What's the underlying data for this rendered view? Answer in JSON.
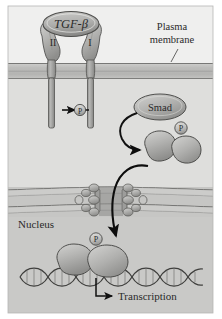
{
  "figure": {
    "background_color": "#ffffff",
    "panel_color": "#d8d8d6",
    "extracellular_color": "#ececeb",
    "cytoplasm_color": "#dddddb",
    "nucleus_color": "#c9c9c7",
    "membrane_color": "#c2c2c0",
    "protein_fill": "#b9b9b7",
    "protein_stroke": "#5a5a58",
    "outline_color": "#555553",
    "arrow_color": "#111111",
    "text_color": "#2a2a2a"
  },
  "labels": {
    "ligand": "TGF-β",
    "receptor_type2": "II",
    "receptor_type1": "I",
    "plasma_membrane_line1": "Plasma",
    "plasma_membrane_line2": "membrane",
    "smad": "Smad",
    "phosphate_receptor": "P",
    "phosphate_smad_complex": "P",
    "phosphate_nuclear_complex": "P",
    "nucleus": "Nucleus",
    "transcription": "Transcription"
  },
  "regions": [
    {
      "name": "extracellular-space",
      "label": ""
    },
    {
      "name": "plasma-membrane",
      "label": "Plasma membrane"
    },
    {
      "name": "cytoplasm",
      "label": ""
    },
    {
      "name": "nuclear-envelope",
      "label": ""
    },
    {
      "name": "nucleus",
      "label": "Nucleus"
    }
  ],
  "steps": [
    {
      "order": 1,
      "name": "ligand-binding",
      "text": "TGF-β"
    },
    {
      "order": 2,
      "name": "receptor-phosphorylation",
      "text": "P"
    },
    {
      "order": 3,
      "name": "smad-recruitment",
      "text": "Smad"
    },
    {
      "order": 4,
      "name": "smad-complex-formation",
      "text": "P"
    },
    {
      "order": 5,
      "name": "nuclear-import",
      "text": ""
    },
    {
      "order": 6,
      "name": "dna-binding-transcription",
      "text": "Transcription"
    }
  ]
}
